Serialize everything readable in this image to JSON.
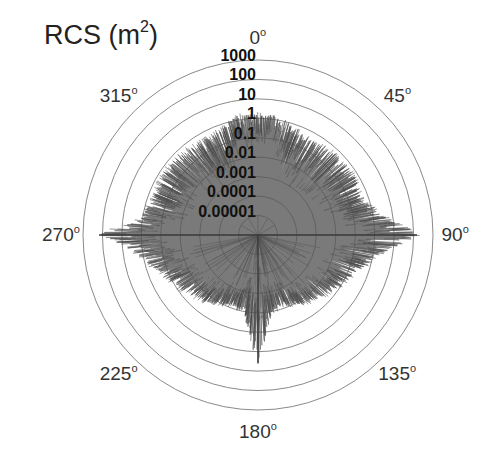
{
  "chart_data": {
    "type": "polar",
    "title": "RCS (m2)",
    "title_base": "RCS (m",
    "title_sup": "2",
    "title_close": ")",
    "radial_scale": "log10",
    "radial_unit": "m^2",
    "radial_range": [
      1e-06,
      1000
    ],
    "radial_ticks": [
      "1000",
      "100",
      "10",
      "1",
      "0.1",
      "0.01",
      "0.001",
      "0.0001",
      "0.00001"
    ],
    "angular_ticks": [
      {
        "label": "0",
        "deg": 0
      },
      {
        "label": "45",
        "deg": 45
      },
      {
        "label": "90",
        "deg": 90
      },
      {
        "label": "135",
        "deg": 135
      },
      {
        "label": "180",
        "deg": 180
      },
      {
        "label": "225",
        "deg": 225
      },
      {
        "label": "270",
        "deg": 270
      },
      {
        "label": "315",
        "deg": 315
      }
    ],
    "angle_direction": "clockwise",
    "zero_location": "top",
    "grid": true,
    "degree_symbol": "o",
    "series": [
      {
        "name": "RCS",
        "color": "#555555",
        "envelope_log10": {
          "deg": [
            0,
            10,
            20,
            30,
            40,
            50,
            60,
            70,
            80,
            85,
            88,
            90,
            92,
            95,
            100,
            110,
            120,
            130,
            140,
            150,
            160,
            170,
            175,
            178,
            180,
            182,
            185,
            190,
            200,
            210,
            220,
            230,
            240,
            250,
            260,
            268,
            270,
            272,
            275,
            280,
            290,
            300,
            310,
            320,
            330,
            340,
            350,
            360
          ],
          "max": [
            0.2,
            0.2,
            -0.3,
            -0.4,
            -0.3,
            -0.2,
            -0.2,
            -0.4,
            0.3,
            1.2,
            1.9,
            2.2,
            1.9,
            1.0,
            0.2,
            -0.6,
            -1.0,
            -1.3,
            -1.6,
            -1.9,
            -2.2,
            -2.0,
            -1.0,
            0.0,
            0.6,
            0.0,
            -1.0,
            -2.0,
            -2.2,
            -1.9,
            -1.6,
            -1.3,
            -1.0,
            -0.6,
            0.2,
            1.4,
            2.2,
            1.6,
            0.6,
            0.0,
            -0.3,
            -0.2,
            -0.2,
            -0.3,
            -0.4,
            -0.3,
            0.2,
            0.2
          ],
          "min": [
            -1.5,
            -1.5,
            -3.0,
            -3.2,
            -3.0,
            -2.8,
            -2.6,
            -2.5,
            -2.0,
            -1.5,
            -1.0,
            -0.5,
            -1.0,
            -1.5,
            -2.0,
            -2.4,
            -2.6,
            -2.8,
            -3.0,
            -3.2,
            -3.4,
            -3.8,
            -4.5,
            -5.0,
            -5.0,
            -5.0,
            -4.5,
            -3.8,
            -3.4,
            -3.2,
            -3.0,
            -2.8,
            -2.6,
            -2.4,
            -2.0,
            -1.0,
            -0.5,
            -1.0,
            -1.5,
            -2.0,
            -2.5,
            -2.6,
            -2.8,
            -3.0,
            -3.2,
            -3.0,
            -1.5,
            -1.5
          ]
        },
        "peaks": [
          {
            "deg": 90,
            "rcs_m2": 150
          },
          {
            "deg": 270,
            "rcs_m2": 150
          },
          {
            "deg": 180,
            "rcs_m2": 4
          }
        ]
      }
    ]
  }
}
